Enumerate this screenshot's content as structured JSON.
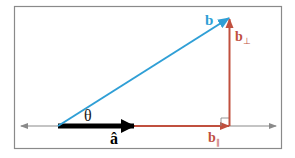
{
  "diagram": {
    "labels": {
      "b": "b",
      "b_perp": "b",
      "b_perp_sub": "⊥",
      "b_par": "b",
      "b_par_sub": "∥",
      "a_hat": "â",
      "theta": "θ"
    },
    "colors": {
      "frame": "#8a8a8a",
      "axis": "#8a8a8a",
      "b_vector": "#2f9fd6",
      "projection": "#c0503f",
      "a_hat": "#000000",
      "text": "#1a1a1a"
    },
    "elements": [
      {
        "name": "axis-line",
        "description": "horizontal double-headed axis line"
      },
      {
        "name": "vector-a-hat",
        "description": "black unit vector along axis"
      },
      {
        "name": "vector-b",
        "description": "blue vector at angle theta"
      },
      {
        "name": "vector-b-parallel",
        "description": "red parallel component along axis"
      },
      {
        "name": "vector-b-perpendicular",
        "description": "red perpendicular component"
      },
      {
        "name": "right-angle-marker",
        "description": "small square at foot of perpendicular"
      }
    ]
  }
}
